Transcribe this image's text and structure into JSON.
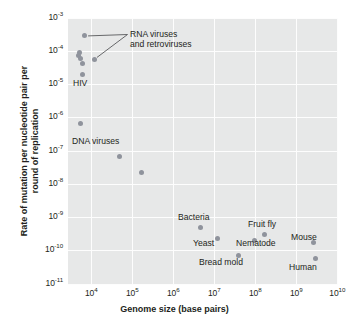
{
  "chart_data": {
    "type": "scatter",
    "title": "",
    "xlabel": "Genome size (base pairs)",
    "ylabel_line1": "Rate of mutation per nucleotide pair per",
    "ylabel_line2": "round of replication",
    "xscale": "log",
    "yscale": "log",
    "xlim": [
      3000,
      10000000000
    ],
    "ylim": [
      1e-11,
      0.001
    ],
    "grid": true,
    "legend": "none",
    "marker_color": "#8f939c",
    "plot_background": "#e7e8e8",
    "gridline_color": "#fdfdfd",
    "xticks": [
      {
        "label": "10",
        "exp": "4",
        "value": 10000
      },
      {
        "label": "10",
        "exp": "5",
        "value": 100000
      },
      {
        "label": "10",
        "exp": "6",
        "value": 1000000
      },
      {
        "label": "10",
        "exp": "7",
        "value": 10000000
      },
      {
        "label": "10",
        "exp": "8",
        "value": 100000000
      },
      {
        "label": "10",
        "exp": "9",
        "value": 1000000000
      },
      {
        "label": "10",
        "exp": "10",
        "value": 10000000000
      }
    ],
    "yticks": [
      {
        "label": "10",
        "exp": "-3",
        "value": 0.001
      },
      {
        "label": "10",
        "exp": "-4",
        "value": 0.0001
      },
      {
        "label": "10",
        "exp": "-5",
        "value": 1e-05
      },
      {
        "label": "10",
        "exp": "-6",
        "value": 1e-06
      },
      {
        "label": "10",
        "exp": "-7",
        "value": 1e-07
      },
      {
        "label": "10",
        "exp": "-8",
        "value": 1e-08
      },
      {
        "label": "10",
        "exp": "-9",
        "value": 1e-09
      },
      {
        "label": "10",
        "exp": "-10",
        "value": 1e-10
      },
      {
        "label": "10",
        "exp": "-11",
        "value": 1e-11
      }
    ],
    "points": [
      {
        "name": "rna-virus-1",
        "x": 7000,
        "y": 0.00028
      },
      {
        "name": "rna-virus-2",
        "x": 5200,
        "y": 9e-05
      },
      {
        "name": "rna-virus-3",
        "x": 5000,
        "y": 7e-05
      },
      {
        "name": "rna-virus-4",
        "x": 5400,
        "y": 6e-05
      },
      {
        "name": "rna-virus-5",
        "x": 12000,
        "y": 5.5e-05
      },
      {
        "name": "rna-virus-6",
        "x": 6200,
        "y": 4e-05
      },
      {
        "name": "hiv",
        "x": 6000,
        "y": 1.9e-05
      },
      {
        "name": "dna-virus-1",
        "x": 5400,
        "y": 6.5e-07
      },
      {
        "name": "dna-virus-2",
        "x": 48000,
        "y": 6.8e-08
      },
      {
        "name": "dna-virus-3",
        "x": 170000,
        "y": 2.2e-08
      },
      {
        "name": "bacteria",
        "x": 4600000,
        "y": 5e-10
      },
      {
        "name": "yeast",
        "x": 12000000,
        "y": 2.2e-10
      },
      {
        "name": "bread-mold",
        "x": 40000000,
        "y": 7e-11
      },
      {
        "name": "nematode",
        "x": 97000000,
        "y": 2e-10
      },
      {
        "name": "fruit-fly",
        "x": 170000000,
        "y": 2.9e-10
      },
      {
        "name": "mouse",
        "x": 2700000000,
        "y": 1.7e-10
      },
      {
        "name": "human",
        "x": 3000000000,
        "y": 5.5e-11
      }
    ],
    "annotations": [
      {
        "name": "rna-viruses",
        "text_line1": "RNA viruses",
        "text_line2": "and retroviruses"
      },
      {
        "name": "hiv",
        "text": "HIV"
      },
      {
        "name": "dna-viruses",
        "text": "DNA viruses"
      },
      {
        "name": "bacteria",
        "text": "Bacteria"
      },
      {
        "name": "yeast",
        "text": "Yeast"
      },
      {
        "name": "bread-mold",
        "text": "Bread mold"
      },
      {
        "name": "nematode",
        "text": "Nematode"
      },
      {
        "name": "fruit-fly",
        "text": "Fruit fly"
      },
      {
        "name": "mouse",
        "text": "Mouse"
      },
      {
        "name": "human",
        "text": "Human"
      }
    ]
  }
}
